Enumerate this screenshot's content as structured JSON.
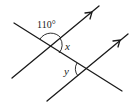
{
  "diagram": {
    "type": "parallel-lines-transversal",
    "labels": {
      "given_angle": "110°",
      "angle_x": "x",
      "angle_y": "y"
    },
    "parallel_line_count": 2,
    "transversal_count": 1
  }
}
